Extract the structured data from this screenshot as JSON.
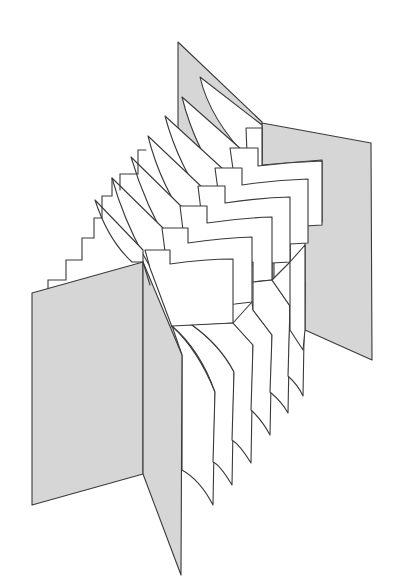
{
  "figure": {
    "title": "Accordion-fold book (concertina) illustration",
    "colors": {
      "cover_fill": "#d6d6d6",
      "page_fill": "#ffffff",
      "outline": "#3a3a3a",
      "background": "#ffffff"
    },
    "parts": {
      "front_cover": "front cover panel",
      "front_spine": "front cover hinge panel",
      "back_cover": "back cover panel",
      "back_spine": "back cover hinge panel",
      "pages": "folded pages",
      "page_count": 7
    }
  }
}
